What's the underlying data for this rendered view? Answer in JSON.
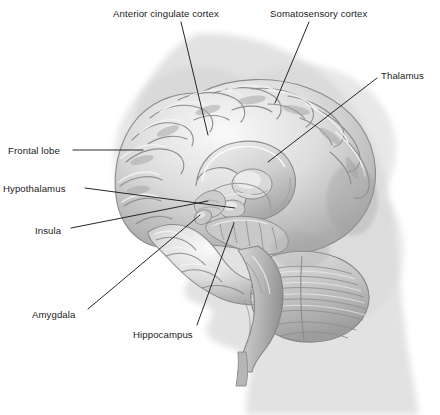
{
  "figure": {
    "style": "grayscale medical illustration",
    "colors": {
      "background": "#ffffff",
      "silhouette": "#e2e2e2",
      "silhouette_shadow": "#d4d4d4",
      "brain_light": "#f2f2f2",
      "brain_mid": "#c8c8c8",
      "brain_dark": "#8d8d8d",
      "brain_outline": "#7a7a7a",
      "leader_line": "#1b1b1b",
      "label_text": "#1b1b1b"
    }
  },
  "labels": [
    {
      "id": "anterior-cingulate-cortex",
      "text": "Anterior cingulate cortex",
      "x": 113,
      "y": 9,
      "anchor": "start"
    },
    {
      "id": "somatosensory-cortex",
      "text": "Somatosensory cortex",
      "x": 270,
      "y": 9,
      "anchor": "start"
    },
    {
      "id": "thalamus",
      "text": "Thalamus",
      "x": 381,
      "y": 71,
      "anchor": "start"
    },
    {
      "id": "frontal-lobe",
      "text": "Frontal lobe",
      "x": 8,
      "y": 146,
      "anchor": "start"
    },
    {
      "id": "hypothalamus",
      "text": "Hypothalamus",
      "x": 3,
      "y": 184,
      "anchor": "start"
    },
    {
      "id": "insula",
      "text": "Insula",
      "x": 35,
      "y": 226,
      "anchor": "start"
    },
    {
      "id": "amygdala",
      "text": "Amygdala",
      "x": 32,
      "y": 310,
      "anchor": "start"
    },
    {
      "id": "hippocampus",
      "text": "Hippocampus",
      "x": 133,
      "y": 330,
      "anchor": "start"
    }
  ],
  "leader_lines": [
    {
      "id": "leader-anterior-cingulate-cortex",
      "points": "181,22 208,135"
    },
    {
      "id": "leader-somatosensory-cortex",
      "points": "309,22 275,103"
    },
    {
      "id": "leader-thalamus",
      "points": "377,78 268,162"
    },
    {
      "id": "leader-frontal-lobe",
      "points": "73,150 143,150"
    },
    {
      "id": "leader-hypothalamus",
      "points": "85,188 235,208"
    },
    {
      "id": "leader-insula",
      "points": "71,228 208,201"
    },
    {
      "id": "leader-amygdala",
      "points": "88,309 200,215"
    },
    {
      "id": "leader-hippocampus",
      "points": "197,325 234,223"
    }
  ]
}
